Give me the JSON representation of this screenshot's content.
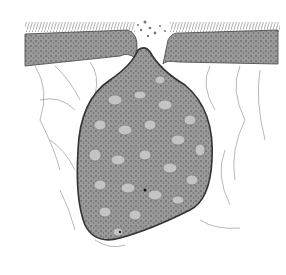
{
  "figure": {
    "style": "pen-and-ink stipple drawing",
    "colors": {
      "background": "#ffffff",
      "ink": "#333333",
      "epithelium": "#9a9a9a",
      "sac_fill": "#8c8c8c",
      "cell_fill": "#c4c4c4"
    }
  }
}
